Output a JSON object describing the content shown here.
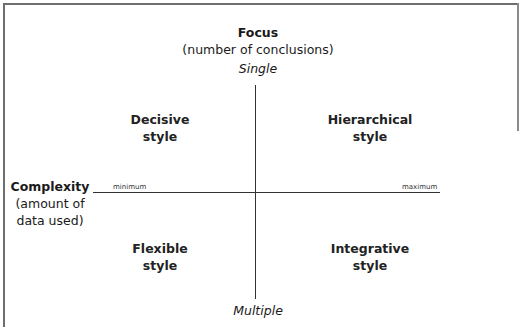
{
  "diagram": {
    "type": "quadrant",
    "vertical_axis": {
      "title": "Focus",
      "subtitle": "(number of conclusions)",
      "top_label": "Single",
      "bottom_label": "Multiple"
    },
    "horizontal_axis": {
      "title": "Complexity",
      "subtitle_line1": "(amount of",
      "subtitle_line2": "data used)",
      "min_label": "minimum",
      "max_label": "maximum"
    },
    "quadrants": [
      {
        "position": "top-left",
        "line1": "Decisive",
        "line2": "style"
      },
      {
        "position": "top-right",
        "line1": "Hierarchical",
        "line2": "style"
      },
      {
        "position": "bottom-left",
        "line1": "Flexible",
        "line2": "style"
      },
      {
        "position": "bottom-right",
        "line1": "Integrative",
        "line2": "style"
      }
    ]
  },
  "colors": {
    "axis": "#333333",
    "frame": "#6e6e6e",
    "text": "#1a1a1a",
    "background": "#ffffff"
  }
}
